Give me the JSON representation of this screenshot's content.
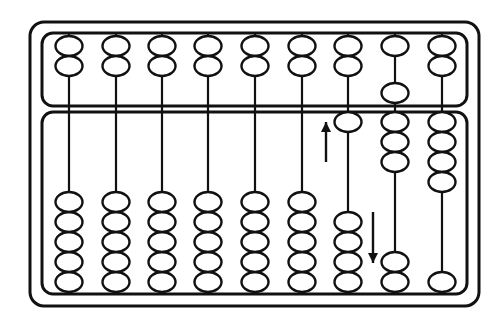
{
  "figure": {
    "kind": "abacus-diagram",
    "name": "soroban-abacus",
    "caption": "",
    "canvas": {
      "width": 503,
      "height": 326
    },
    "colors": {
      "stroke": "#111111",
      "background": "#ffffff",
      "bead_fill": "#ffffff",
      "frame_fill": "#ffffff"
    },
    "stroke_widths": {
      "outer_frame": 3.0,
      "deck_frame": 3.0,
      "rod": 2.2,
      "bead": 2.4,
      "arrow": 2.4
    }
  },
  "frame": {
    "outer": {
      "x": 30,
      "y": 22,
      "width": 449,
      "height": 284,
      "radius": 14
    },
    "upper_deck": {
      "x": 42,
      "y": 33,
      "width": 425,
      "height": 73,
      "radius": 11
    },
    "lower_deck": {
      "x": 42,
      "y": 112,
      "width": 425,
      "height": 182,
      "radius": 11
    }
  },
  "geometry": {
    "rod_x": [
      69,
      116,
      162,
      208,
      255,
      302,
      348,
      395,
      442
    ],
    "bead_rx": 13.5,
    "bead_ry": 10.0,
    "upper_bead_pitch": 20,
    "lower_bead_pitch": 20,
    "upper_top_y": 46,
    "upper_beam_y": 93,
    "lower_top_y": 122,
    "lower_bottom_y": 282
  },
  "decks": [
    {
      "name": "upper-deck",
      "label": "heaven-deck",
      "beads_per_rod": 2,
      "rods": [
        {
          "index": 1,
          "beads_up": 2,
          "beads_down": 0,
          "value": 0
        },
        {
          "index": 2,
          "beads_up": 2,
          "beads_down": 0,
          "value": 0
        },
        {
          "index": 3,
          "beads_up": 2,
          "beads_down": 0,
          "value": 0
        },
        {
          "index": 4,
          "beads_up": 2,
          "beads_down": 0,
          "value": 0
        },
        {
          "index": 5,
          "beads_up": 2,
          "beads_down": 0,
          "value": 0
        },
        {
          "index": 6,
          "beads_up": 2,
          "beads_down": 0,
          "value": 0
        },
        {
          "index": 7,
          "beads_up": 2,
          "beads_down": 0,
          "value": 0
        },
        {
          "index": 8,
          "beads_up": 1,
          "beads_down": 1,
          "value": 5
        },
        {
          "index": 9,
          "beads_up": 2,
          "beads_down": 0,
          "value": 0
        }
      ]
    },
    {
      "name": "lower-deck",
      "label": "earth-deck",
      "beads_per_rod": 5,
      "rods": [
        {
          "index": 1,
          "beads_up": 0,
          "beads_mid": 0,
          "beads_down": 5,
          "value": 0
        },
        {
          "index": 2,
          "beads_up": 0,
          "beads_mid": 0,
          "beads_down": 5,
          "value": 0
        },
        {
          "index": 3,
          "beads_up": 0,
          "beads_mid": 0,
          "beads_down": 5,
          "value": 0
        },
        {
          "index": 4,
          "beads_up": 0,
          "beads_mid": 0,
          "beads_down": 5,
          "value": 0
        },
        {
          "index": 5,
          "beads_up": 0,
          "beads_mid": 0,
          "beads_down": 5,
          "value": 0
        },
        {
          "index": 6,
          "beads_up": 0,
          "beads_mid": 0,
          "beads_down": 5,
          "value": 0
        },
        {
          "index": 7,
          "beads_up": 1,
          "beads_mid": 0,
          "beads_down": 4,
          "value": 1
        },
        {
          "index": 8,
          "beads_up": 3,
          "beads_mid": 1,
          "beads_down": 1,
          "value": 3
        },
        {
          "index": 9,
          "beads_up": 4,
          "beads_mid": 0,
          "beads_down": 1,
          "value": 4
        }
      ]
    }
  ],
  "annotations": [
    {
      "name": "up-arrow",
      "direction": "up",
      "near_rod": 7,
      "x": 326,
      "y_tail": 162,
      "y_head": 122,
      "head_size": 5
    },
    {
      "name": "down-arrow",
      "direction": "down",
      "near_rod": 8,
      "x": 373,
      "y_tail": 212,
      "y_head": 263,
      "head_size": 5
    }
  ]
}
